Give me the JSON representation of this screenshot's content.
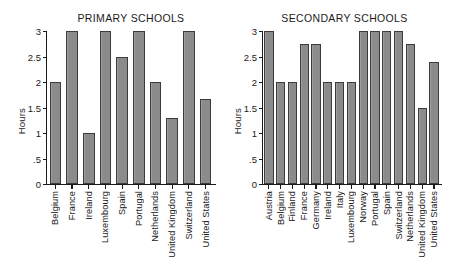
{
  "figure": {
    "width": 451,
    "height": 278,
    "background": "#ffffff",
    "bar_fill": "#8b8b8b",
    "bar_edge": "#3b3b3b",
    "axis_color": "#1a1a1a"
  },
  "chart_data": [
    {
      "type": "bar",
      "title": "PRIMARY SCHOOLS",
      "xlabel": "",
      "ylabel": "Hours",
      "ylim": [
        0,
        3
      ],
      "yticks": [
        0,
        0.5,
        1,
        1.5,
        2,
        2.5,
        3
      ],
      "ytick_labels": [
        "0",
        ".5",
        "1",
        "1.5",
        "2",
        "2.5",
        "3"
      ],
      "grid": false,
      "legend": "none",
      "categories": [
        "Belgium",
        "France",
        "Ireland",
        "Luxembourg",
        "Spain",
        "Portugal",
        "Netherlands",
        "United Kingdom",
        "Switzerland",
        "United States"
      ],
      "values": [
        2.0,
        3.0,
        1.0,
        3.0,
        2.5,
        3.0,
        2.0,
        1.3,
        3.0,
        1.67
      ]
    },
    {
      "type": "bar",
      "title": "SECONDARY SCHOOLS",
      "xlabel": "",
      "ylabel": "Hours",
      "ylim": [
        0,
        3
      ],
      "yticks": [
        0,
        0.5,
        1,
        1.5,
        2,
        2.5,
        3
      ],
      "ytick_labels": [
        "0",
        ".5",
        "1",
        "1.5",
        "2",
        "2.5",
        "3"
      ],
      "grid": false,
      "legend": "none",
      "categories": [
        "Austria",
        "Belgium",
        "Finland",
        "France",
        "Germany",
        "Ireland",
        "Italy",
        "Luxembourg",
        "Norway",
        "Portugal",
        "Spain",
        "Switzerland",
        "Netherlands",
        "United Kingdom",
        "United States"
      ],
      "values": [
        3.0,
        2.0,
        2.0,
        2.75,
        2.75,
        2.0,
        2.0,
        2.0,
        3.0,
        3.0,
        3.0,
        3.0,
        2.75,
        1.5,
        2.4
      ]
    }
  ]
}
